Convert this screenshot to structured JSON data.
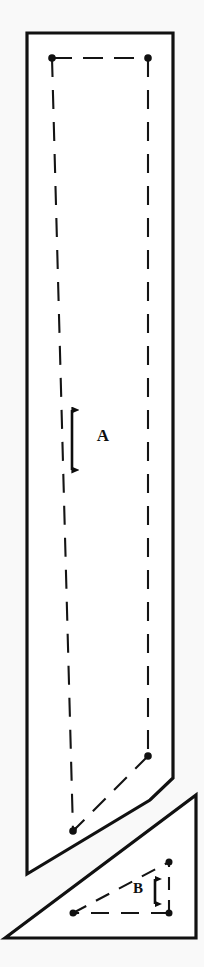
{
  "figure": {
    "background_color": "#f9f9f9",
    "line_color": "#111111",
    "fill_color": "#ffffff",
    "width": 204,
    "height": 967
  },
  "labels": {
    "dimension_a": "A",
    "dimension_b": "B"
  },
  "shapes": {
    "upper_body": {
      "name": "upper-elongated-polygon",
      "outline_points": "27,33 173,33 173,778 150,800 27,874",
      "description": "tall narrow polygon with angled lower-right and lower edge"
    },
    "lower_triangle": {
      "name": "lower-right-triangle",
      "outline_points": "5,938 196,795 196,938",
      "description": "right triangle resting on the bottom edge"
    }
  },
  "dashed_construction": {
    "upper_inner": {
      "name": "upper-inner-dashed-quad",
      "points": "52,58 148,58 148,756 73,831"
    },
    "lower_inner": {
      "name": "lower-inner-dashed-triangle",
      "points": "73,913 169,913 169,862"
    }
  },
  "vertex_dots": [
    {
      "name": "dot-upper-left",
      "x": 52,
      "y": 58,
      "r": 3.6
    },
    {
      "name": "dot-upper-right",
      "x": 148,
      "y": 58,
      "r": 3.6
    },
    {
      "name": "dot-mid-right",
      "x": 148,
      "y": 756,
      "r": 3.6
    },
    {
      "name": "dot-lower-left",
      "x": 73,
      "y": 831,
      "r": 3.6
    },
    {
      "name": "dot-tri-bottom-left",
      "x": 73,
      "y": 913,
      "r": 3.4
    },
    {
      "name": "dot-tri-bottom-right",
      "x": 169,
      "y": 913,
      "r": 3.4
    },
    {
      "name": "dot-tri-apex",
      "x": 169,
      "y": 862,
      "r": 3.4
    }
  ],
  "dimension_arrows": {
    "arrow_a": {
      "name": "dimension-arrow-a",
      "x": 72,
      "y_top": 403,
      "y_bottom": 477,
      "label_x": 103,
      "label_y": 437,
      "font_size": 17
    },
    "arrow_b": {
      "name": "dimension-arrow-b",
      "x": 155,
      "y_top": 872,
      "y_bottom": 911,
      "label_x": 138,
      "label_y": 890,
      "font_size": 15
    }
  }
}
